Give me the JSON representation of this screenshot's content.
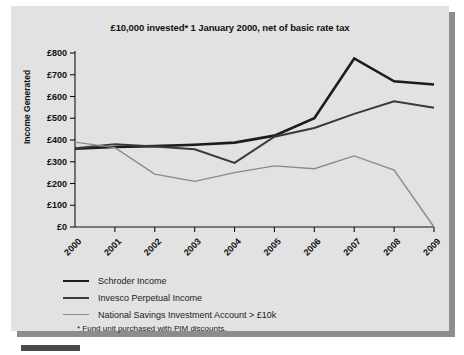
{
  "panel": {
    "background_color": "#e2e2e2",
    "shadow_color": "#8d8d8d"
  },
  "chart_data": {
    "type": "line",
    "title": "£10,000 invested* 1 January 2000, net of basic rate tax",
    "xlabel": "",
    "ylabel": "Income Generated",
    "categories": [
      "2000",
      "2001",
      "2002",
      "2003",
      "2004",
      "2005",
      "2006",
      "2007",
      "2008",
      "2009"
    ],
    "ylim": [
      0,
      800
    ],
    "ytick_values": [
      0,
      100,
      200,
      300,
      400,
      500,
      600,
      700,
      800
    ],
    "ytick_labels": [
      "£0",
      "£100",
      "£200",
      "£300",
      "£400",
      "£500",
      "£600",
      "£700",
      "£800"
    ],
    "grid": false,
    "legend_position": "below",
    "series": [
      {
        "name": "Schroder Income",
        "color": "#1c1c1c",
        "width": 2.6,
        "values": [
          360,
          368,
          372,
          378,
          388,
          420,
          500,
          775,
          670,
          655
        ]
      },
      {
        "name": "Invesco Perpetual Income",
        "color": "#3a3a3a",
        "width": 2.0,
        "values": [
          362,
          381,
          370,
          357,
          295,
          415,
          455,
          520,
          578,
          548
        ]
      },
      {
        "name": "National Savings Investment Account > £10k",
        "color": "#8a8a8a",
        "width": 1.4,
        "values": [
          390,
          365,
          243,
          210,
          250,
          281,
          268,
          327,
          262,
          0
        ]
      }
    ],
    "footnote": "* Fund unit purchased with PIM discounts."
  }
}
